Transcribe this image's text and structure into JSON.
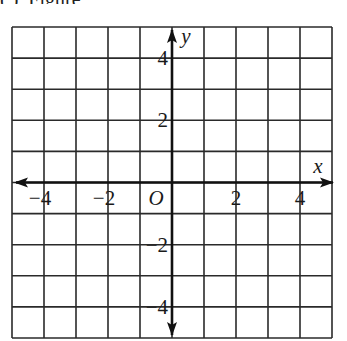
{
  "top_text_fragment": "(    ), Figure",
  "grid": {
    "columns": 10,
    "rows": 10,
    "left": 12,
    "top": 27,
    "cell_width": 32,
    "cell_height": 31.1,
    "line_color": "#2a2a2a"
  },
  "axes": {
    "x_label": "x",
    "y_label": "y",
    "origin_label": "O",
    "x_ticks": [
      {
        "value": -4,
        "label": "−4"
      },
      {
        "value": -2,
        "label": "−2"
      },
      {
        "value": 2,
        "label": "2"
      },
      {
        "value": 4,
        "label": "4"
      }
    ],
    "y_ticks": [
      {
        "value": 4,
        "label": "4"
      },
      {
        "value": 2,
        "label": "2"
      },
      {
        "value": -2,
        "label": "−2"
      },
      {
        "value": -4,
        "label": "−4"
      }
    ],
    "range": {
      "x": [
        -5,
        5
      ],
      "y": [
        -5,
        5
      ]
    }
  }
}
